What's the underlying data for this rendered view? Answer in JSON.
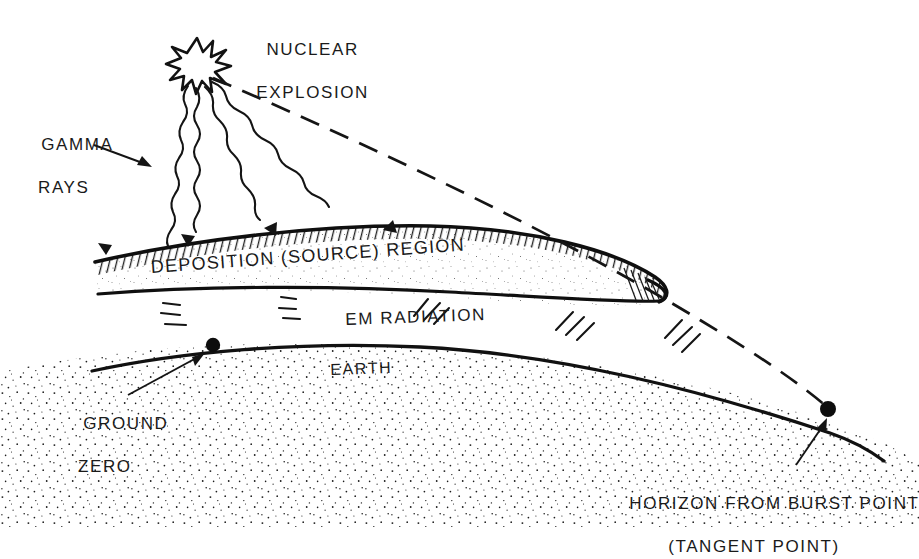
{
  "diagram": {
    "background_color": "#ffffff",
    "ink_color": "#141414"
  },
  "labels": {
    "nuclear_explosion_line1": "NUCLEAR",
    "nuclear_explosion_line2": "EXPLOSION",
    "gamma_rays_line1": "GAMMA",
    "gamma_rays_line2": "RAYS",
    "deposition_region": "DEPOSITION (SOURCE) REGION",
    "em_radiation": "EM RADIATION",
    "earth": "EARTH",
    "ground_zero_line1": "GROUND",
    "ground_zero_line2": "ZERO",
    "horizon_line1": "HORIZON FROM BURST POINT",
    "horizon_line2": "(TANGENT POINT)"
  },
  "features": {
    "burst_marker": "starburst-icon",
    "ground_zero_marker": "dot-marker",
    "tangent_point_marker": "dot-marker",
    "gamma_ray_style": "wavy-arrow",
    "line_of_sight_style": "dashed",
    "earth_fill": "stipple",
    "deposition_fill": "stipple-with-hatch-top"
  },
  "geometry": {
    "burst_point": [
      197,
      66
    ],
    "ground_zero_point": [
      213,
      345
    ],
    "tangent_point": [
      828,
      409
    ],
    "gamma_ray_arrow_tips": [
      [
        105,
        258
      ],
      [
        186,
        250
      ],
      [
        273,
        240
      ],
      [
        394,
        236
      ]
    ],
    "deposition_band_right_cap": [
      667,
      296
    ],
    "em_radiation_mark_groups": [
      [
        170,
        310
      ],
      [
        286,
        305
      ],
      [
        424,
        310
      ],
      [
        570,
        318
      ],
      [
        676,
        330
      ]
    ]
  }
}
